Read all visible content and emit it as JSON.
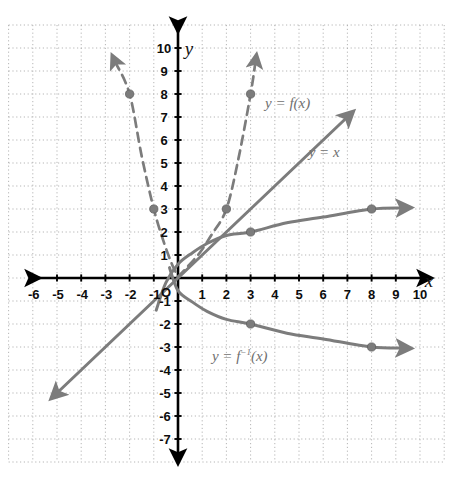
{
  "figure": {
    "kind": "coordinate-graph",
    "axis_x_name": "x",
    "axis_y_name": "y",
    "origin_label": "O"
  },
  "axes": {
    "x_ticks": [
      "-6",
      "-5",
      "-4",
      "-3",
      "-2",
      "-1",
      "1",
      "2",
      "3",
      "4",
      "5",
      "6",
      "7",
      "8",
      "9",
      "10"
    ],
    "y_ticks": [
      "10",
      "9",
      "8",
      "7",
      "6",
      "5",
      "4",
      "3",
      "2",
      "1",
      "-1",
      "-2",
      "-3",
      "-4",
      "-5",
      "-6",
      "-7"
    ],
    "x_min": -7,
    "x_max": 11,
    "y_min": -8,
    "y_max": 11
  },
  "labels": {
    "f_label": "y = f(x)",
    "identity_label": "y = x",
    "finv_label_prefix": "y = f",
    "finv_label_exp": "−1",
    "finv_label_suffix": "(x)"
  },
  "colors": {
    "curve": "#7c7c7c",
    "axis": "#000000",
    "grid": "#a9a9a9",
    "label": "#6f6f6f",
    "tick_text": "#0d0d0d"
  },
  "chart_data": {
    "type": "line",
    "title": "",
    "xlabel": "x",
    "ylabel": "y",
    "xlim": [
      -7,
      11
    ],
    "ylim": [
      -8,
      11
    ],
    "grid": true,
    "legend": "inline-annotations",
    "series": [
      {
        "name": "y = f(x)",
        "style": "dashed",
        "branch": "left",
        "points": [
          [
            -2.6,
            9.4
          ],
          [
            -2,
            8
          ],
          [
            -1.5,
            5.3
          ],
          [
            -1,
            3
          ],
          [
            -0.6,
            1.6
          ],
          [
            -0.25,
            0.6
          ],
          [
            0,
            0.05
          ]
        ],
        "markers": [
          [
            -2,
            8
          ],
          [
            -1,
            3
          ]
        ],
        "arrow_end": "start"
      },
      {
        "name": "y = f(x)",
        "style": "dashed",
        "branch": "right",
        "points": [
          [
            0,
            0.05
          ],
          [
            0.4,
            0.5
          ],
          [
            0.9,
            1.1
          ],
          [
            1.4,
            1.9
          ],
          [
            2,
            3
          ],
          [
            2.5,
            5.2
          ],
          [
            3,
            8
          ],
          [
            3.2,
            9.4
          ]
        ],
        "markers": [
          [
            2,
            3
          ],
          [
            3,
            8
          ]
        ],
        "arrow_end": "end"
      },
      {
        "name": "y = x",
        "style": "solid",
        "points": [
          [
            -5,
            -5
          ],
          [
            7,
            7
          ]
        ],
        "markers": [],
        "arrow_end": "both"
      },
      {
        "name": "y = f⁻¹(x)",
        "style": "solid",
        "branch": "upper",
        "points": [
          [
            -0.9,
            -1.4
          ],
          [
            -0.5,
            -0.2
          ],
          [
            0,
            0.6
          ],
          [
            0.6,
            1.1
          ],
          [
            1.2,
            1.5
          ],
          [
            2,
            1.85
          ],
          [
            3,
            2
          ],
          [
            4.5,
            2.4
          ],
          [
            6,
            2.65
          ],
          [
            8,
            3
          ],
          [
            9.3,
            3.05
          ]
        ],
        "markers": [
          [
            3,
            2
          ],
          [
            8,
            3
          ]
        ],
        "arrow_end": "end"
      },
      {
        "name": "y = f⁻¹(x)",
        "style": "solid",
        "branch": "lower",
        "points": [
          [
            -0.35,
            0.45
          ],
          [
            0,
            -0.55
          ],
          [
            0.6,
            -1.05
          ],
          [
            1.2,
            -1.45
          ],
          [
            2,
            -1.8
          ],
          [
            3,
            -2
          ],
          [
            4.5,
            -2.4
          ],
          [
            6,
            -2.65
          ],
          [
            8,
            -3
          ],
          [
            9.3,
            -3.05
          ]
        ],
        "markers": [
          [
            3,
            -2
          ],
          [
            8,
            -3
          ]
        ],
        "arrow_end": "end"
      }
    ],
    "annotations": [
      {
        "text": "y = f(x)",
        "x": 3.6,
        "y": 7.6
      },
      {
        "text": "y = x",
        "x": 5.4,
        "y": 5.5
      },
      {
        "text": "y = f⁻¹(x)",
        "x": 1.4,
        "y": -3.35
      }
    ]
  }
}
